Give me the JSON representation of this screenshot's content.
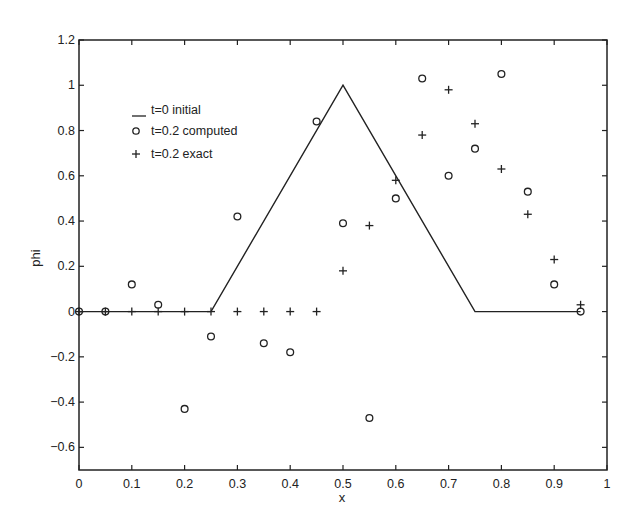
{
  "chart_data": {
    "type": "line",
    "title": "",
    "xlabel": "x",
    "ylabel": "phi",
    "xlim": [
      0,
      1
    ],
    "ylim": [
      -0.7,
      1.2
    ],
    "grid": false,
    "legend_position": "upper-left",
    "x_ticks": [
      "0",
      "0.1",
      "0.2",
      "0.3",
      "0.4",
      "0.5",
      "0.6",
      "0.7",
      "0.8",
      "0.9",
      "1"
    ],
    "y_ticks": [
      "1.2",
      "1",
      "0.8",
      "0.6",
      "0.4",
      "0.2",
      "0",
      "-0.2",
      "-0.4",
      "-0.6"
    ],
    "series": [
      {
        "name": "t=0 initial",
        "style": "line",
        "x": [
          0,
          0.25,
          0.5,
          0.75,
          0.95
        ],
        "y": [
          0,
          0,
          1,
          0,
          0
        ]
      },
      {
        "name": "t=0.2 computed",
        "style": "circle",
        "x": [
          0,
          0.05,
          0.1,
          0.15,
          0.2,
          0.25,
          0.3,
          0.35,
          0.4,
          0.45,
          0.5,
          0.55,
          0.6,
          0.65,
          0.7,
          0.75,
          0.8,
          0.85,
          0.9,
          0.95
        ],
        "y": [
          0,
          0,
          0.12,
          0.03,
          -0.43,
          -0.11,
          0.42,
          -0.14,
          -0.18,
          0.84,
          0.39,
          -0.47,
          0.5,
          1.03,
          0.6,
          0.72,
          1.05,
          0.53,
          0.12,
          0
        ]
      },
      {
        "name": "t=0.2 exact",
        "style": "plus",
        "x": [
          0,
          0.05,
          0.1,
          0.15,
          0.2,
          0.25,
          0.3,
          0.35,
          0.4,
          0.45,
          0.5,
          0.55,
          0.6,
          0.65,
          0.7,
          0.75,
          0.8,
          0.85,
          0.9,
          0.95
        ],
        "y": [
          0,
          0,
          0,
          0,
          0,
          0,
          0,
          0,
          0,
          0,
          0.18,
          0.38,
          0.58,
          0.78,
          0.98,
          0.83,
          0.63,
          0.43,
          0.23,
          0.03
        ]
      }
    ]
  },
  "legend": {
    "items": [
      "t=0 initial",
      "t=0.2 computed",
      "t=0.2 exact"
    ]
  }
}
